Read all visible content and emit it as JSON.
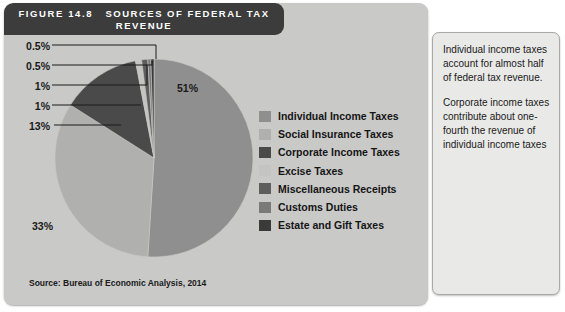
{
  "figure": {
    "number_label": "FIGURE 14.8",
    "title": "SOURCES OF FEDERAL TAX REVENUE",
    "source_note": "Source: Bureau of Economic Analysis, 2014"
  },
  "side_panel": {
    "paragraphs": [
      "Individual income taxes account for almost half of federal tax revenue.",
      "Corporate income taxes contribute about one-fourth the revenue of individual income taxes"
    ]
  },
  "chart_data": {
    "type": "pie",
    "title": "SOURCES OF FEDERAL TAX REVENUE",
    "source": "Source: Bureau of Economic Analysis, 2014",
    "legend_position": "right",
    "categories": [
      "Individual Income Taxes",
      "Social Insurance Taxes",
      "Corporate Income Taxes",
      "Excise Taxes",
      "Miscellaneous Receipts",
      "Customs Duties",
      "Estate and Gift Taxes"
    ],
    "values": [
      51,
      33,
      13,
      1,
      1,
      0.5,
      0.5
    ],
    "value_labels": [
      "51%",
      "33%",
      "13%",
      "1%",
      "1%",
      "0.5%",
      "0.5%"
    ],
    "colors": [
      "#8f8f8f",
      "#b0b0ae",
      "#4a4a4a",
      "#c4c4c2",
      "#5e5e5e",
      "#7a7a7a",
      "#3a3a3a"
    ],
    "callout_labels_left": [
      "0.5%",
      "0.5%",
      "1%",
      "1%",
      "13%"
    ],
    "callout_label_right": "51%",
    "callout_label_lower_left": "33%"
  },
  "colors": {
    "title_bar": "#3c3c3c",
    "panel_background": "#c9c9c7",
    "side_panel_background": "#e9e9e7",
    "text": "#1a1a1a"
  }
}
